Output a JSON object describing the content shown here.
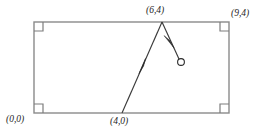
{
  "figure": {
    "labels": {
      "origin": "(0,0)",
      "bottom_point": "(4,0)",
      "apex": "(6,4)",
      "top_right": "(9,4)"
    },
    "colors": {
      "rectangle_stroke": "#8a8a8a",
      "path_stroke": "#3a3a3a",
      "corner_marker_stroke": "#7d7d7d",
      "ball_stroke": "#2b2b2b",
      "background": "#ffffff",
      "text": "#262626"
    }
  },
  "diagram_data": {
    "type": "geometry",
    "rectangle": {
      "corners_px": [
        [
          34,
          22
        ],
        [
          229,
          22
        ],
        [
          229,
          113
        ],
        [
          34,
          113
        ]
      ],
      "corner_labels": [
        "(0,0)",
        "(9,4)",
        "(4,0)",
        "(6,4)"
      ],
      "right_angle_markers": 4,
      "marker_size_px": 9
    },
    "path": {
      "segments": [
        {
          "name": "incoming",
          "from_px": [
            122,
            113
          ],
          "to_px": [
            162,
            22
          ],
          "from_label": "(4,0)",
          "to_label": "(6,4)",
          "arrow_direction": "up-right",
          "arrow_at_px": [
            142,
            67
          ]
        },
        {
          "name": "outgoing",
          "from_px": [
            162,
            22
          ],
          "to_px": [
            180,
            61
          ],
          "from_label": "(6,4)",
          "arrow_direction": "down-right",
          "arrow_at_px": [
            170,
            41
          ]
        }
      ]
    },
    "ball": {
      "center_px": [
        181,
        62
      ],
      "radius_px": 3.4,
      "filled": false
    }
  }
}
